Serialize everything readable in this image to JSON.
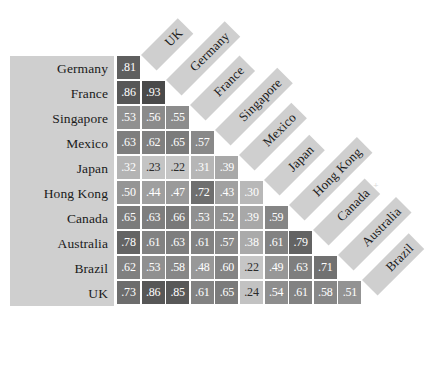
{
  "figure": {
    "name": "correlation-matrix",
    "row_labels": [
      "Germany",
      "France",
      "Singapore",
      "Mexico",
      "Japan",
      "Hong Kong",
      "Canada",
      "Australia",
      "Brazil",
      "UK"
    ],
    "column_labels": [
      "UK",
      "Germany",
      "France",
      "Singapore",
      "Mexico",
      "Japan",
      "Hong Kong",
      "Canada",
      "Australia",
      "Brazil"
    ],
    "artifact_mark": "⁺"
  },
  "chart_data": {
    "type": "heatmap",
    "title": "",
    "xlabel": "",
    "ylabel": "",
    "shape": "lower-triangular",
    "grid": false,
    "legend": "none",
    "value_range": [
      0.22,
      0.93
    ],
    "colormap": {
      "low": "#c9c9c9",
      "high": "#4a4a4a",
      "description": "darker shade indicates higher correlation"
    },
    "row_categories": [
      "Germany",
      "France",
      "Singapore",
      "Mexico",
      "Japan",
      "Hong Kong",
      "Canada",
      "Australia",
      "Brazil",
      "UK"
    ],
    "column_categories": [
      "UK",
      "Germany",
      "France",
      "Singapore",
      "Mexico",
      "Japan",
      "Hong Kong",
      "Canada",
      "Australia",
      "Brazil"
    ],
    "rows": [
      {
        "label": "Germany",
        "values": [
          ".81"
        ]
      },
      {
        "label": "France",
        "values": [
          ".86",
          ".93"
        ]
      },
      {
        "label": "Singapore",
        "values": [
          ".53",
          ".56",
          ".55"
        ]
      },
      {
        "label": "Mexico",
        "values": [
          ".63",
          ".62",
          ".65",
          ".57"
        ]
      },
      {
        "label": "Japan",
        "values": [
          ".32",
          ".23",
          ".22",
          ".31",
          ".39"
        ]
      },
      {
        "label": "Hong Kong",
        "values": [
          ".50",
          ".44",
          ".47",
          ".72",
          ".43",
          ".30"
        ]
      },
      {
        "label": "Canada",
        "values": [
          ".65",
          ".63",
          ".66",
          ".53",
          ".52",
          ".39",
          ".59"
        ]
      },
      {
        "label": "Australia",
        "values": [
          ".78",
          ".61",
          ".63",
          ".61",
          ".57",
          ".38",
          ".61",
          ".79"
        ]
      },
      {
        "label": "Brazil",
        "values": [
          ".62",
          ".53",
          ".58",
          ".48",
          ".60",
          ".22",
          ".49",
          ".63",
          ".71"
        ]
      },
      {
        "label": "UK",
        "values": [
          ".73",
          ".86",
          ".85",
          ".61",
          ".65",
          ".24",
          ".54",
          ".61",
          ".58",
          ".51"
        ]
      }
    ],
    "numeric_rows": [
      [
        0.81
      ],
      [
        0.86,
        0.93
      ],
      [
        0.53,
        0.56,
        0.55
      ],
      [
        0.63,
        0.62,
        0.65,
        0.57
      ],
      [
        0.32,
        0.23,
        0.22,
        0.31,
        0.39
      ],
      [
        0.5,
        0.44,
        0.47,
        0.72,
        0.43,
        0.3
      ],
      [
        0.65,
        0.63,
        0.66,
        0.53,
        0.52,
        0.39,
        0.59
      ],
      [
        0.78,
        0.61,
        0.63,
        0.61,
        0.57,
        0.38,
        0.61,
        0.79
      ],
      [
        0.62,
        0.53,
        0.58,
        0.48,
        0.6,
        0.22,
        0.49,
        0.63,
        0.71
      ],
      [
        0.73,
        0.86,
        0.85,
        0.61,
        0.65,
        0.24,
        0.54,
        0.61,
        0.58,
        0.51
      ]
    ]
  }
}
